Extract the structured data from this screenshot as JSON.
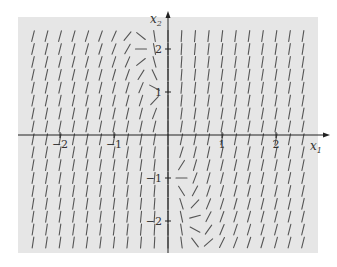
{
  "chart_data": {
    "type": "direction_field",
    "title": "",
    "xlabel": "x1",
    "ylabel": "x2",
    "xlim": [
      -2.75,
      2.75
    ],
    "ylim": [
      -2.75,
      2.75
    ],
    "x_ticks": [
      -2,
      -1,
      1,
      2
    ],
    "y_ticks": [
      -2,
      -1,
      1,
      2
    ],
    "x_tick_labels": [
      "−2",
      "−1",
      "1",
      "2"
    ],
    "y_tick_labels": [
      "−2",
      "−1",
      "1",
      "2"
    ],
    "grid": false,
    "field": {
      "description": "Slope field of a 2D linear-like system; segments nearly vertical far from x2-axis, near horizontal along line x1 ≈ -0.25·x2",
      "dx1": {
        "a": 0.15,
        "b": 0.0
      },
      "dx2": {
        "c": 1.0,
        "d": 0.25
      },
      "x_start": -2.5,
      "x_step": 0.25,
      "x_count": 21,
      "y_start": -2.5,
      "y_step": 0.3,
      "y_count": 17,
      "segment_length_px": 11
    }
  },
  "style": {
    "background": "#e6e6e6",
    "segment_color": "#555555",
    "axis_color": "#222222",
    "label_color": "#333333"
  },
  "frame": {
    "left": 18,
    "top": 17,
    "right": 318,
    "bottom": 253
  },
  "origin_px": {
    "x": 168,
    "y": 135
  },
  "scale_px": {
    "x": 54,
    "y": 43
  },
  "axis_labels": {
    "x": "x",
    "x_sub": "1",
    "y": "x",
    "y_sub": "2"
  }
}
